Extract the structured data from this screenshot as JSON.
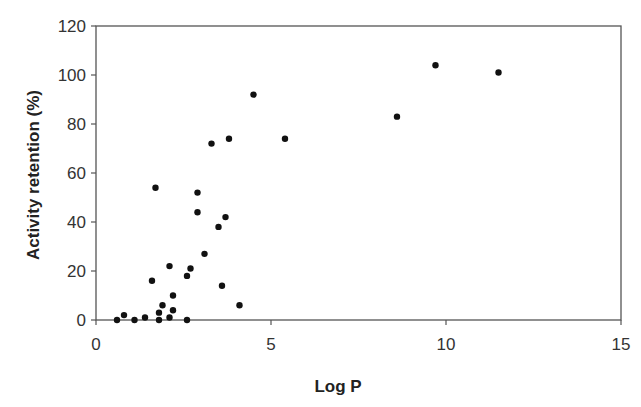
{
  "chart_data": {
    "type": "scatter",
    "title": "",
    "xlabel": "Log P",
    "ylabel": "Activity retention (%)",
    "xlim": [
      0,
      15
    ],
    "ylim": [
      0,
      120
    ],
    "x_ticks": [
      0,
      5,
      10,
      15
    ],
    "y_ticks": [
      0,
      20,
      40,
      60,
      80,
      100,
      120
    ],
    "grid": false,
    "legend": null,
    "marker_color": "#111111",
    "series": [
      {
        "name": "data",
        "points": [
          {
            "x": 0.6,
            "y": 0
          },
          {
            "x": 0.8,
            "y": 2
          },
          {
            "x": 1.1,
            "y": 0
          },
          {
            "x": 1.4,
            "y": 1
          },
          {
            "x": 1.6,
            "y": 16
          },
          {
            "x": 1.7,
            "y": 54
          },
          {
            "x": 1.8,
            "y": 3
          },
          {
            "x": 1.8,
            "y": 0
          },
          {
            "x": 1.9,
            "y": 6
          },
          {
            "x": 2.1,
            "y": 22
          },
          {
            "x": 2.1,
            "y": 1
          },
          {
            "x": 2.2,
            "y": 10
          },
          {
            "x": 2.2,
            "y": 4
          },
          {
            "x": 2.6,
            "y": 0
          },
          {
            "x": 2.6,
            "y": 18
          },
          {
            "x": 2.7,
            "y": 21
          },
          {
            "x": 2.9,
            "y": 52
          },
          {
            "x": 2.9,
            "y": 44
          },
          {
            "x": 3.1,
            "y": 27
          },
          {
            "x": 3.3,
            "y": 72
          },
          {
            "x": 3.5,
            "y": 38
          },
          {
            "x": 3.6,
            "y": 14
          },
          {
            "x": 3.7,
            "y": 42
          },
          {
            "x": 3.8,
            "y": 74
          },
          {
            "x": 4.1,
            "y": 6
          },
          {
            "x": 4.5,
            "y": 92
          },
          {
            "x": 5.4,
            "y": 74
          },
          {
            "x": 8.6,
            "y": 83
          },
          {
            "x": 9.7,
            "y": 104
          },
          {
            "x": 11.5,
            "y": 101
          }
        ]
      }
    ]
  }
}
